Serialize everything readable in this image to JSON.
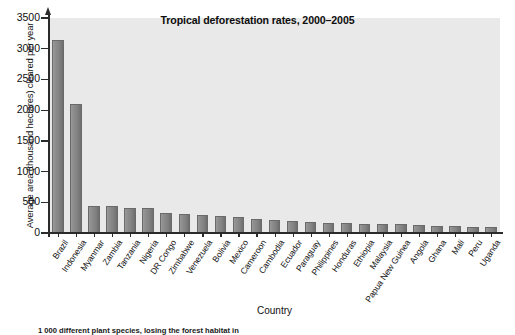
{
  "chart_data": {
    "type": "bar",
    "title": "Tropical deforestation rates, 2000–2005",
    "xlabel": "Country",
    "ylabel": "Average area (thousand hectares) cleared per year",
    "ylim": [
      0,
      3500
    ],
    "yticks": [
      0,
      500,
      1000,
      1500,
      2000,
      2500,
      3000,
      3500
    ],
    "ytick_labels": [
      "0",
      "500",
      "1000",
      "1500",
      "2000",
      "2500",
      "3000",
      "3500"
    ],
    "grid": false,
    "legend": null,
    "bar_color": "#8a8a8a",
    "plot_background": "#e9e9e9",
    "categories": [
      "Brazil",
      "Indonesia",
      "Myanmar",
      "Zambia",
      "Tanzania",
      "Nigeria",
      "DR Congo",
      "Zimbabwe",
      "Venezuela",
      "Bolivia",
      "Mexico",
      "Cameroon",
      "Cambodia",
      "Ecuador",
      "Paraguay",
      "Philippines",
      "Honduras",
      "Ethiopia",
      "Malaysia",
      "Papua New Guinea",
      "Angola",
      "Ghana",
      "Mali",
      "Peru",
      "Uganda"
    ],
    "values": [
      3150,
      2100,
      440,
      440,
      410,
      410,
      320,
      310,
      290,
      270,
      260,
      230,
      220,
      200,
      180,
      160,
      155,
      145,
      140,
      140,
      125,
      120,
      110,
      100,
      90
    ]
  },
  "figure": {
    "caption": "1 000 different plant species, losing the forest habitat in"
  },
  "axis_title": {
    "x": "Country",
    "y": "Average area (thousand hectares) cleared per year"
  }
}
